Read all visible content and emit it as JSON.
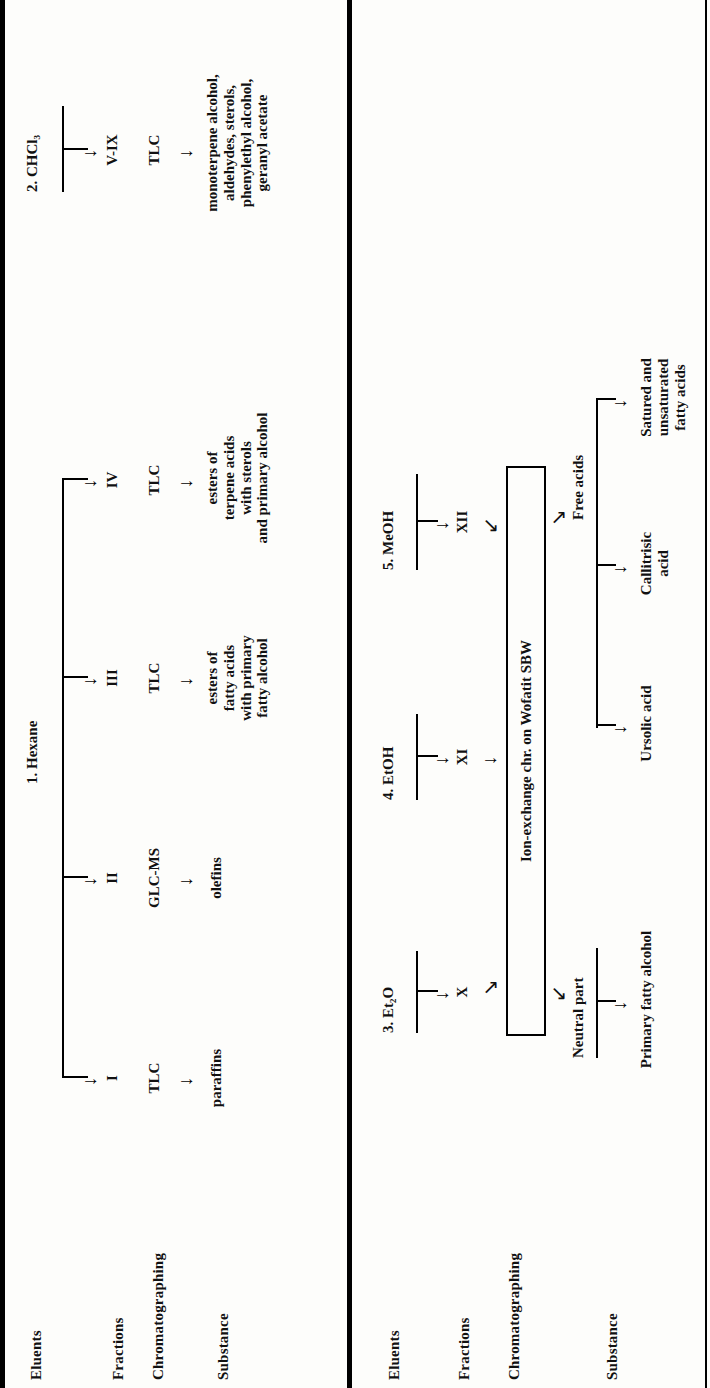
{
  "figure": {
    "type": "flow-diagram",
    "title_present": false,
    "orientation": "rotated-90-ccw",
    "row_labels": [
      "Eluents",
      "Fractions",
      "Chromatographing",
      "Substance"
    ]
  },
  "panel1": {
    "row_labels": {
      "eluents": "Eluents",
      "fractions": "Fractions",
      "chromatographing": "Chromatographing",
      "substance": "Substance"
    },
    "eluents": [
      {
        "label": "1. Hexane"
      },
      {
        "label": "2. CHCl₃"
      }
    ],
    "branches": [
      {
        "eluent": "1. Hexane",
        "fraction": "I",
        "chromatographing": "TLC",
        "substance": "paraffins"
      },
      {
        "eluent": "1. Hexane",
        "fraction": "II",
        "chromatographing": "GLC-MS",
        "substance": "olefins"
      },
      {
        "eluent": "1. Hexane",
        "fraction": "III",
        "chromatographing": "TLC",
        "substance": "esters of\nfatty acids\nwith primary\nfatty alcohol"
      },
      {
        "eluent": "1. Hexane",
        "fraction": "IV",
        "chromatographing": "TLC",
        "substance": "esters of\nterpene acids\nwith sterols\nand primary alcohol"
      },
      {
        "eluent": "2. CHCl₃",
        "fraction": "V-IX",
        "chromatographing": "TLC",
        "substance": "monoterpene alcohol,\naldehydes, sterols,\nphenylethyl alcohol,\ngeranyl acetate"
      }
    ]
  },
  "panel2": {
    "row_labels": {
      "eluents": "Eluents",
      "fractions": "Fractions",
      "chromatographing": "Chromatographing",
      "substance": "Substance"
    },
    "eluents": [
      {
        "label": "3. Et₂O"
      },
      {
        "label": "4. EtOH"
      },
      {
        "label": "5. MeOH"
      }
    ],
    "fractions": [
      "X",
      "XI",
      "XII"
    ],
    "chromatographing_box": "Ion-exchange chr. on Wofatit SBW",
    "outputs": [
      {
        "label": "Neutral part"
      },
      {
        "label": "Free acids"
      }
    ],
    "substances": [
      "Primary fatty alcohol",
      "Ursolic acid",
      "Callitrisic\nacid",
      "Satured and\nunsaturated\nfatty acids"
    ]
  },
  "icons": {
    "arrow_right": "→",
    "arrow_up_right": "↗",
    "arrow_down_right": "↘"
  }
}
